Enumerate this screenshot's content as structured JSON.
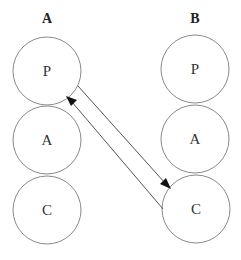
{
  "diagram": {
    "columns": [
      {
        "title": "A",
        "nodes": [
          {
            "label": "P"
          },
          {
            "label": "A"
          },
          {
            "label": "C"
          }
        ]
      },
      {
        "title": "B",
        "nodes": [
          {
            "label": "P"
          },
          {
            "label": "A"
          },
          {
            "label": "C"
          }
        ]
      }
    ],
    "edges": [
      {
        "from": "A.P",
        "to": "B.C",
        "direction": "down-right"
      },
      {
        "from": "B.C",
        "to": "A.P",
        "direction": "up-left"
      }
    ],
    "colors": {
      "circle_stroke": "#8a8a8a",
      "arrow": "#111111",
      "text": "#333333"
    }
  }
}
